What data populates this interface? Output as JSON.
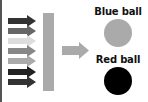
{
  "diagram": {
    "input_arrows": [
      {
        "color": "#333333"
      },
      {
        "color": "#666666"
      },
      {
        "color": "#dddddd"
      },
      {
        "color": "#888888"
      },
      {
        "color": "#aaaaaa"
      },
      {
        "color": "#222222"
      },
      {
        "color": "#333333"
      }
    ],
    "filter_bar": {
      "color": "#aaaaaa"
    },
    "output_arrow": {
      "color": "#aaaaaa"
    },
    "outputs": [
      {
        "label": "Blue ball",
        "color": "#aaaaaa"
      },
      {
        "label": "Red ball",
        "color": "#000000"
      }
    ]
  }
}
